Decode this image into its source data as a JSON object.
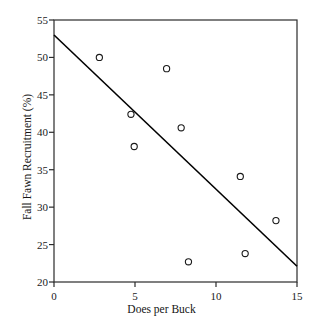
{
  "chart_data": {
    "type": "scatter",
    "title": "",
    "xlabel": "Does per Buck",
    "ylabel": "Fall Fawn Recruitment (%)",
    "xlim": [
      0,
      15
    ],
    "ylim": [
      20,
      55
    ],
    "xticks": [
      "0",
      "5",
      "10",
      "15"
    ],
    "xtick_values": [
      0,
      5,
      10,
      15
    ],
    "yticks": [
      "20",
      "25",
      "30",
      "35",
      "40",
      "45",
      "50",
      "55"
    ],
    "ytick_values": [
      20,
      25,
      30,
      35,
      40,
      45,
      50,
      55
    ],
    "grid": false,
    "legend": "none",
    "frame": "box",
    "marker": "open-circle",
    "marker_color": "#1a1a1a",
    "line_color": "#000000",
    "points": [
      {
        "x": 2.8,
        "y": 50.0
      },
      {
        "x": 4.75,
        "y": 42.4
      },
      {
        "x": 4.95,
        "y": 38.1
      },
      {
        "x": 6.95,
        "y": 48.5
      },
      {
        "x": 7.85,
        "y": 40.6
      },
      {
        "x": 8.3,
        "y": 22.7
      },
      {
        "x": 11.5,
        "y": 34.1
      },
      {
        "x": 11.8,
        "y": 23.8
      },
      {
        "x": 13.7,
        "y": 28.2
      }
    ],
    "trendline": {
      "name": "linear fit",
      "x": [
        0,
        15
      ],
      "y": [
        53.0,
        22.1
      ]
    }
  }
}
